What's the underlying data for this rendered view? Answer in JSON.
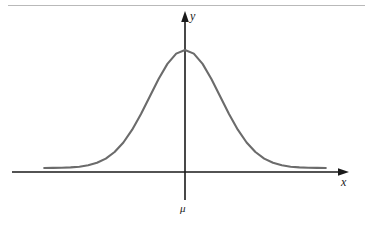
{
  "figure": {
    "title": "",
    "background_color": "#ffffff",
    "top_rule_color": "#b9b9b9",
    "axis_color": "#1a1a1a",
    "curve_color": "#6b6b6b"
  },
  "axes": {
    "y_label": "y",
    "x_label": "x",
    "mean_label": "μ"
  },
  "chart_data": {
    "type": "line",
    "title": "",
    "subtitle": "",
    "xlabel": "x",
    "ylabel": "y",
    "annotations": [
      "μ"
    ],
    "legend": [],
    "legend_position": "none",
    "grid": false,
    "xlim": [
      -4,
      4
    ],
    "ylim": [
      0,
      1.05
    ],
    "xticks": [],
    "yticks": [],
    "series": [
      {
        "name": "normal-density",
        "description": "Symmetric bell-shaped normal probability density curve centered at the mean μ, which lies on the y-axis.",
        "x": [
          -4.0,
          -3.75,
          -3.5,
          -3.25,
          -3.0,
          -2.75,
          -2.5,
          -2.25,
          -2.0,
          -1.75,
          -1.5,
          -1.25,
          -1.0,
          -0.75,
          -0.5,
          -0.25,
          0.0,
          0.25,
          0.5,
          0.75,
          1.0,
          1.25,
          1.5,
          1.75,
          2.0,
          2.25,
          2.5,
          2.75,
          3.0,
          3.25,
          3.5,
          3.75,
          4.0
        ],
        "y": [
          0.0003,
          0.0009,
          0.0022,
          0.0051,
          0.0111,
          0.0228,
          0.0439,
          0.0796,
          0.1353,
          0.2163,
          0.3247,
          0.4578,
          0.6065,
          0.7548,
          0.8825,
          0.9692,
          1.0,
          0.9692,
          0.8825,
          0.7548,
          0.6065,
          0.4578,
          0.3247,
          0.2163,
          0.1353,
          0.0796,
          0.0439,
          0.0228,
          0.0111,
          0.0051,
          0.0022,
          0.0009,
          0.0003
        ]
      }
    ],
    "peak": {
      "x": 0.0,
      "y": 1.0
    }
  }
}
